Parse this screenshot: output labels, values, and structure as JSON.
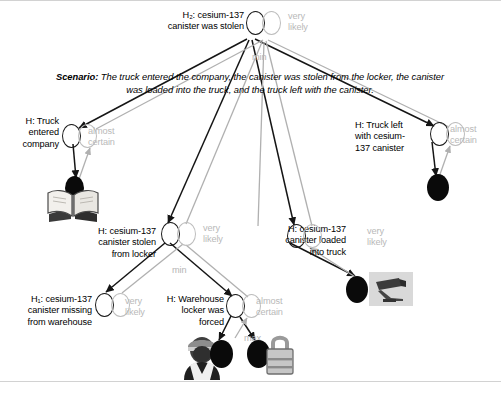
{
  "diagram": {
    "scenario_prefix": "Scenario:",
    "scenario_text": "The truck entered the company, the canister was stolen from the locker, the canister was loaded into the truck, and the truck left with the canister.",
    "colors": {
      "node_outline": "#1a1a1a",
      "node_outline_alt": "#bdbdbd",
      "evidence_fill": "#0a0a0a",
      "probability_text": "#b9b9b9",
      "edge_strong": "#151515",
      "edge_weak": "#b0b0b0",
      "background": "#ffffff"
    },
    "nodes": [
      {
        "id": "h2-root",
        "label": "H₂: cesium-137\ncanister was stolen",
        "probability": "very\nlikely",
        "combiner": "min"
      },
      {
        "id": "h-truck-entered",
        "label": "H: Truck\nentered\ncompany",
        "probability": "almost\ncertain",
        "combiner": ""
      },
      {
        "id": "h-truck-left",
        "label": "H: Truck left\nwith cesium-\n137 canister",
        "probability": "almost\ncertain",
        "combiner": ""
      },
      {
        "id": "h-canister-stolen-locker",
        "label": "H: cesium-137\ncanister stolen\nfrom locker",
        "probability": "very\nlikely",
        "combiner": "min"
      },
      {
        "id": "h-canister-loaded-truck",
        "label": "H: cesium-137\ncanister loaded\ninto truck",
        "probability": "very\nlikely",
        "combiner": ""
      },
      {
        "id": "h1-canister-missing",
        "label": "H₁: cesium-137\ncanister missing\nfrom warehouse",
        "probability": "very\nlikely",
        "combiner": ""
      },
      {
        "id": "h-locker-forced",
        "label": "H: Warehouse\nlocker was\nforced",
        "probability": "almost\ncertain",
        "combiner": "max"
      }
    ],
    "evidence": [
      {
        "id": "evidence-book",
        "icon": "open-book-icon"
      },
      {
        "id": "evidence-truck-left",
        "icon": "evidence-dot-icon"
      },
      {
        "id": "evidence-camera",
        "icon": "security-camera-icon"
      },
      {
        "id": "evidence-guard",
        "icon": "security-guard-icon"
      },
      {
        "id": "evidence-padlock",
        "icon": "padlock-icon"
      }
    ]
  }
}
